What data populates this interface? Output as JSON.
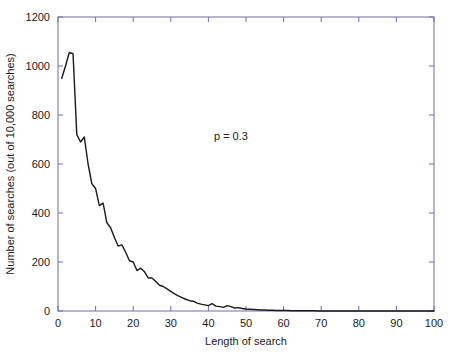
{
  "chart_data": {
    "type": "line",
    "title": "",
    "xlabel": "Length of search",
    "ylabel": "Number of searches (out of 10,000 searches)",
    "xlim": [
      0,
      100
    ],
    "ylim": [
      0,
      1200
    ],
    "xticks": [
      0,
      10,
      20,
      30,
      40,
      50,
      60,
      70,
      80,
      90,
      100
    ],
    "yticks": [
      0,
      200,
      400,
      600,
      800,
      1000,
      1200
    ],
    "xtick_labels": [
      "0",
      "10",
      "20",
      "30",
      "40",
      "50",
      "60",
      "70",
      "80",
      "90",
      "100"
    ],
    "ytick_labels": [
      "0",
      "200",
      "400",
      "600",
      "800",
      "1000",
      "1200"
    ],
    "grid": false,
    "legend": "none",
    "line_color": "#1a1a1a",
    "line_width": 1.4,
    "annotations": [
      {
        "text": "p = 0.3",
        "x": 46,
        "y": 700
      }
    ],
    "series": [
      {
        "name": "searches",
        "x": [
          1,
          2,
          3,
          4,
          5,
          6,
          7,
          8,
          9,
          10,
          11,
          12,
          13,
          14,
          15,
          16,
          17,
          18,
          19,
          20,
          21,
          22,
          23,
          24,
          25,
          26,
          27,
          28,
          29,
          30,
          31,
          32,
          33,
          34,
          35,
          36,
          37,
          38,
          39,
          40,
          41,
          42,
          43,
          44,
          45,
          46,
          47,
          48,
          49,
          50,
          51,
          52,
          53,
          54,
          55,
          56,
          57,
          58,
          59,
          60,
          61,
          62,
          63,
          64,
          65,
          66,
          67,
          68,
          69,
          70,
          71,
          72,
          73,
          74,
          75,
          76,
          77,
          78,
          79,
          80,
          81,
          82,
          83,
          84,
          85,
          86,
          87,
          88,
          89,
          90,
          91,
          92,
          93,
          94,
          95,
          96,
          97,
          98,
          99,
          100
        ],
        "values": [
          950,
          1000,
          1055,
          1050,
          720,
          690,
          710,
          600,
          520,
          500,
          430,
          440,
          360,
          340,
          300,
          265,
          270,
          240,
          205,
          200,
          165,
          175,
          160,
          135,
          135,
          120,
          105,
          100,
          90,
          80,
          70,
          62,
          55,
          48,
          42,
          40,
          32,
          28,
          25,
          22,
          30,
          20,
          18,
          15,
          22,
          18,
          12,
          14,
          10,
          8,
          7,
          6,
          5,
          4,
          4,
          3,
          3,
          2,
          2,
          2,
          2,
          1,
          1,
          1,
          1,
          1,
          1,
          1,
          0,
          0,
          0,
          0,
          0,
          0,
          0,
          0,
          0,
          0,
          0,
          0,
          0,
          0,
          0,
          0,
          0,
          0,
          0,
          0,
          0,
          0,
          0,
          0,
          0,
          0,
          0,
          0,
          0,
          0,
          0,
          0
        ]
      }
    ]
  }
}
